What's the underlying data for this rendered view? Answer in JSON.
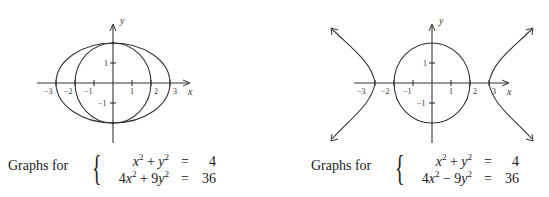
{
  "figures": [
    {
      "id": "left",
      "caption": {
        "lead": "Graphs for",
        "rows": [
          {
            "lhs_html": "x2 + y2",
            "lhs_parts": [
              "x",
              "2",
              " + ",
              "y",
              "2"
            ],
            "eq": "=",
            "rhs": "4"
          },
          {
            "lhs_html": "4x2 + 9y2",
            "lhs_parts": [
              "4",
              "x",
              "2",
              " + 9",
              "y",
              "2"
            ],
            "eq": "=",
            "rhs": "36"
          }
        ]
      },
      "axes": {
        "x_label": "x",
        "y_label": "y",
        "x_ticks": [
          "−3",
          "−2",
          "−1",
          "1",
          "2",
          "3"
        ],
        "y_ticks": [
          "1",
          "−1"
        ]
      },
      "curves": [
        {
          "type": "circle",
          "equation": "x^2 + y^2 = 4",
          "radius": 2
        },
        {
          "type": "ellipse",
          "equation": "4x^2 + 9y^2 = 36",
          "a": 3,
          "b": 2
        }
      ]
    },
    {
      "id": "right",
      "caption": {
        "lead": "Graphs for",
        "rows": [
          {
            "lhs_parts": [
              "x",
              "2",
              " + ",
              "y",
              "2"
            ],
            "eq": "=",
            "rhs": "4"
          },
          {
            "lhs_parts": [
              "4",
              "x",
              "2",
              " − 9",
              "y",
              "2"
            ],
            "eq": "=",
            "rhs": "36"
          }
        ]
      },
      "axes": {
        "x_label": "x",
        "y_label": "y",
        "x_ticks": [
          "−3",
          "−2",
          "−1",
          "1",
          "2",
          "3"
        ],
        "y_ticks": [
          "1",
          "−1"
        ]
      },
      "curves": [
        {
          "type": "circle",
          "equation": "x^2 + y^2 = 4",
          "radius": 2
        },
        {
          "type": "hyperbola",
          "equation": "4x^2 − 9y^2 = 36",
          "a": 3,
          "b": 2
        }
      ]
    }
  ],
  "colors": {
    "stroke": "#333333",
    "text": "#222222",
    "background": "#ffffff"
  }
}
